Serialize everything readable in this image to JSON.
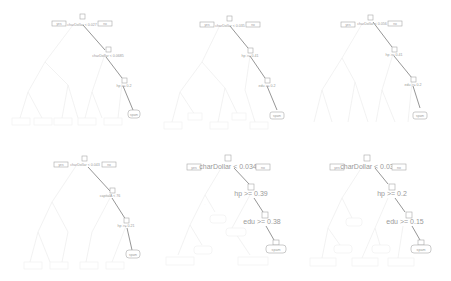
{
  "figure": {
    "panels": [
      {
        "id": "p1",
        "root": {
          "node_id": "1",
          "split": "charDollar < 0.027",
          "left_label": "yes",
          "right_label": "no"
        },
        "path": [
          {
            "node_id": "3",
            "split": "charDollar < 0.0685"
          },
          {
            "node_id": "7",
            "split": "hp >= 0.2"
          }
        ],
        "leaf": {
          "node_id": "15",
          "label": "spam"
        }
      },
      {
        "id": "p2",
        "root": {
          "node_id": "1",
          "split": "charDollar < 0.035",
          "left_label": "yes",
          "right_label": "no"
        },
        "path": [
          {
            "node_id": "3",
            "split": "hp >= 0.41"
          },
          {
            "node_id": "7",
            "split": "edu >= 0.2"
          }
        ],
        "leaf": {
          "node_id": "15",
          "label": "spam"
        }
      },
      {
        "id": "p3",
        "root": {
          "node_id": "1",
          "split": "charDollar < 0.056",
          "left_label": "yes",
          "right_label": "no"
        },
        "path": [
          {
            "node_id": "3",
            "split": "hp >= 0.41"
          },
          {
            "node_id": "7",
            "split": "edu >= 0.2"
          }
        ],
        "leaf": {
          "node_id": "15",
          "label": "spam"
        }
      },
      {
        "id": "p4",
        "root": {
          "node_id": "1",
          "split": "charDollar < 0.043",
          "left_label": "yes",
          "right_label": "no"
        },
        "path": [
          {
            "node_id": "3",
            "split": "capitalA < 76"
          },
          {
            "node_id": "7",
            "split": "hp >= 0.21"
          }
        ],
        "leaf": {
          "node_id": "15",
          "label": "spam"
        }
      },
      {
        "id": "p5",
        "root": {
          "node_id": "1",
          "split": "charDollar < 0.034",
          "left_label": "yes",
          "right_label": "no"
        },
        "path": [
          {
            "node_id": "3",
            "split": "hp >= 0.39"
          },
          {
            "node_id": "7",
            "split": "edu >= 0.38"
          }
        ],
        "leaf": {
          "node_id": "15",
          "label": "spam"
        }
      },
      {
        "id": "p6",
        "root": {
          "node_id": "1",
          "split": "charDollar < 0.03",
          "left_label": "yes",
          "right_label": "no"
        },
        "path": [
          {
            "node_id": "3",
            "split": "hp >= 0.2"
          },
          {
            "node_id": "7",
            "split": "edu >= 0.15"
          }
        ],
        "leaf": {
          "node_id": "15",
          "label": "spam"
        }
      }
    ]
  }
}
